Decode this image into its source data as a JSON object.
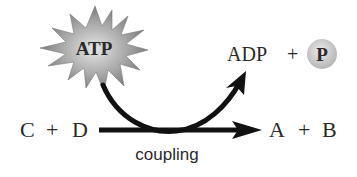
{
  "diagram": {
    "energy_source": {
      "label": "ATP",
      "shape": "starburst",
      "fill": "#9a9a9a"
    },
    "products_top": {
      "left": "ADP",
      "plus": "+",
      "phosphate": {
        "label": "P",
        "shape": "circle",
        "fill": "#c8c8c8"
      }
    },
    "reaction": {
      "reactants": {
        "c": "C",
        "plus": "+",
        "d": "D"
      },
      "products": {
        "a": "A",
        "plus": "+",
        "b": "B"
      },
      "arrow_label": "coupling"
    },
    "colors": {
      "arrow": "#111111",
      "text": "#2a2a2a"
    }
  }
}
